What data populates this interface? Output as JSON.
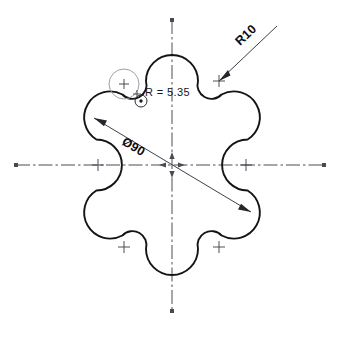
{
  "drawing": {
    "title": "Hexalobular cam profile",
    "background_color": "#ffffff",
    "outline_color": "#141414",
    "centerline_color": "#4a4a55",
    "dimension_color": "#35353d",
    "construction_color": "#9a9aa4",
    "annotations": {
      "lobe_radius_label": "R10",
      "bolt_circle_label": "Ø90",
      "fillet_radius_label": "R = 5.35"
    },
    "geometry": {
      "center_x": 172,
      "center_y": 165,
      "bolt_circle_diameter": 90,
      "bolt_circle_radius_px": 74,
      "lobe_count": 6,
      "lobe_radius_px": 26,
      "fillet_radius_px": 14,
      "lobe_angles_deg": [
        90,
        30,
        -30,
        -90,
        -150,
        150
      ]
    },
    "centerlines": {
      "horizontal": {
        "x1": 16,
        "y1": 165,
        "x2": 326,
        "y2": 165
      },
      "vertical": {
        "x1": 172,
        "y1": 20,
        "x2": 172,
        "y2": 312
      }
    },
    "dimension_leaders": {
      "diameter_line": {
        "x1": 94,
        "y1": 118,
        "x2": 251,
        "y2": 212
      },
      "radius_leader": {
        "x1": 219,
        "y1": 81,
        "x2": 277,
        "y2": 26
      }
    },
    "center_marks": [
      {
        "name": "center-mark-left-lobe",
        "x": 98,
        "y": 165
      },
      {
        "name": "center-mark-right-lobe",
        "x": 246,
        "y": 165
      },
      {
        "name": "center-mark-upper-right-lobe",
        "x": 219,
        "y": 81
      },
      {
        "name": "center-mark-upper-left-lobe",
        "x": 124,
        "y": 84
      },
      {
        "name": "center-mark-lower-left-lobe",
        "x": 124,
        "y": 247
      },
      {
        "name": "center-mark-lower-right-lobe",
        "x": 219,
        "y": 247
      }
    ],
    "detail_circles": {
      "construction_circle": {
        "cx": 124,
        "cy": 84,
        "r": 15
      },
      "small_bore_circle": {
        "cx": 141,
        "cy": 101,
        "r": 6,
        "dot_r": 1.6
      }
    }
  }
}
